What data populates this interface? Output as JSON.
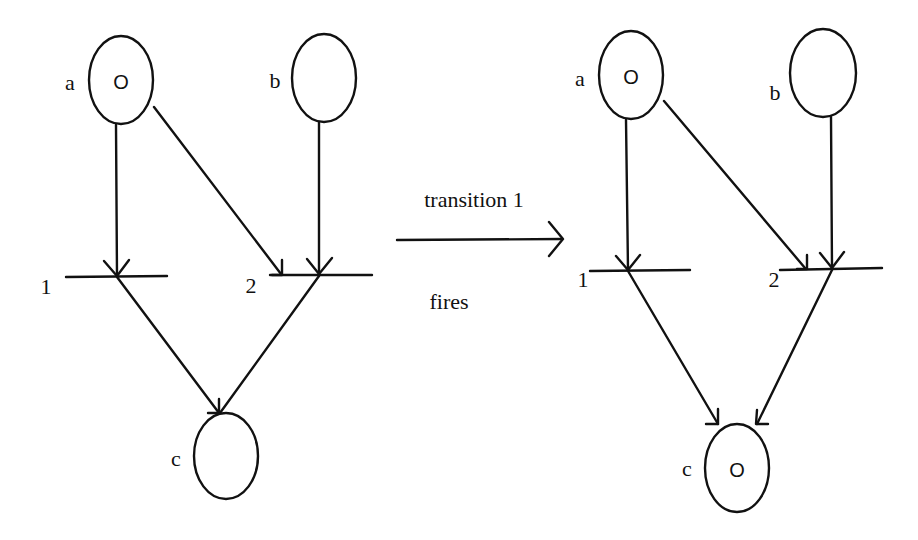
{
  "diagram": {
    "type": "petri-net-firing",
    "caption_top": "transition 1",
    "caption_bottom": "fires",
    "before": {
      "places": [
        {
          "id": "a",
          "label": "a",
          "token": "O"
        },
        {
          "id": "b",
          "label": "b",
          "token": ""
        },
        {
          "id": "c",
          "label": "c",
          "token": ""
        }
      ],
      "transitions": [
        {
          "id": "t1",
          "label": "1"
        },
        {
          "id": "t2",
          "label": "2"
        }
      ]
    },
    "after": {
      "places": [
        {
          "id": "a",
          "label": "a",
          "token": "O"
        },
        {
          "id": "b",
          "label": "b",
          "token": ""
        },
        {
          "id": "c",
          "label": "c",
          "token": "O"
        }
      ],
      "transitions": [
        {
          "id": "t1",
          "label": "1"
        },
        {
          "id": "t2",
          "label": "2"
        }
      ]
    },
    "arcs": [
      {
        "from": "a",
        "to": "1"
      },
      {
        "from": "a",
        "to": "2"
      },
      {
        "from": "b",
        "to": "2"
      },
      {
        "from": "1",
        "to": "c"
      },
      {
        "from": "2",
        "to": "c"
      }
    ]
  }
}
